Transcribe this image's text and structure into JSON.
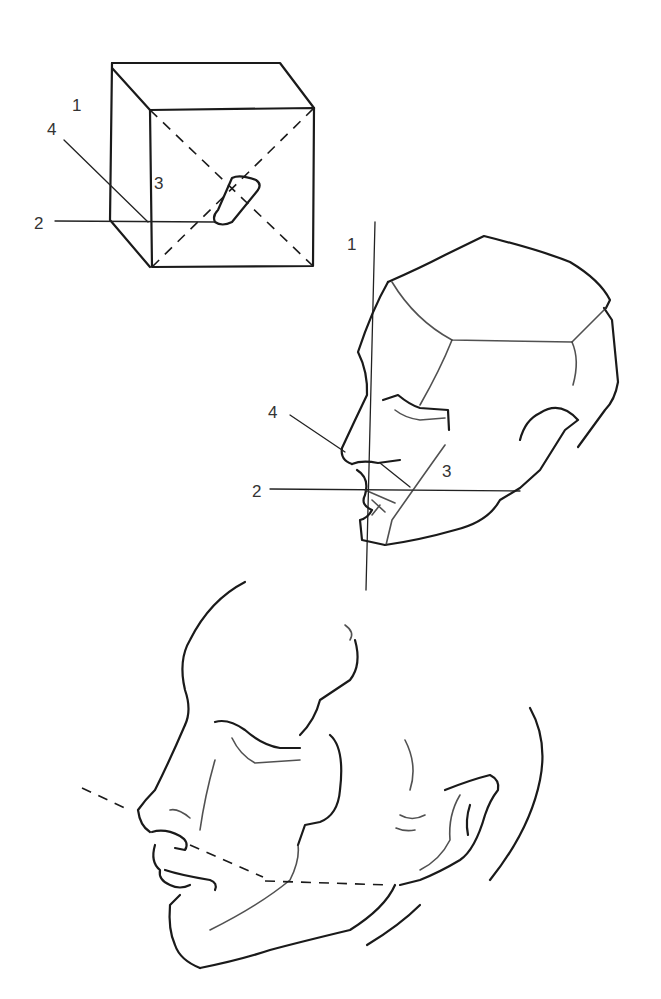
{
  "figure": {
    "cube_diagram": {
      "labels": [
        "1",
        "2",
        "3",
        "4"
      ]
    },
    "planar_head_diagram": {
      "labels": [
        "1",
        "2",
        "3",
        "4"
      ]
    },
    "sketched_head": {
      "labels": []
    }
  }
}
